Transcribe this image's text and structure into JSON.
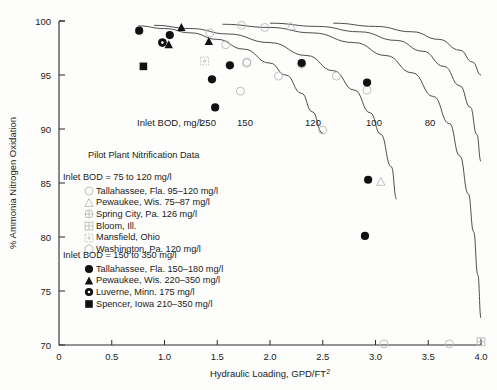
{
  "chart_data": {
    "type": "scatter",
    "title": "Pilot Plant Nitrification Data",
    "xlabel": "Hydraulic Loading, GPD/FT",
    "xlabel_sup": "2",
    "ylabel": "% Ammonia Nitrogen Oxidation",
    "xlim": [
      0,
      4.0
    ],
    "ylim": [
      70,
      100
    ],
    "xticks": [
      "0",
      "0.5",
      "1.0",
      "1.5",
      "2.0",
      "2.5",
      "3.0",
      "3.5",
      "4.0"
    ],
    "xtick_values": [
      0,
      0.5,
      1.0,
      1.5,
      2.0,
      2.5,
      3.0,
      3.5,
      4.0
    ],
    "yticks": [
      "70",
      "75",
      "80",
      "85",
      "90",
      "95",
      "100"
    ],
    "ytick_values": [
      70,
      75,
      80,
      85,
      90,
      95,
      100
    ],
    "grid": false,
    "curve_label_prefix": "Inlet BOD, mg/l",
    "curve_labels": [
      "250",
      "150",
      "120",
      "100",
      "80"
    ],
    "curves": [
      {
        "name": "250",
        "points": [
          [
            0.75,
            99.55
          ],
          [
            1.0,
            99.3
          ],
          [
            1.25,
            98.9
          ],
          [
            1.5,
            98.3
          ],
          [
            1.75,
            97.4
          ],
          [
            2.0,
            96.1
          ],
          [
            2.15,
            95.0
          ],
          [
            2.3,
            93.3
          ],
          [
            2.4,
            91.6
          ],
          [
            2.5,
            89.6
          ]
        ]
      },
      {
        "name": "150",
        "points": [
          [
            0.9,
            99.6
          ],
          [
            1.25,
            99.3
          ],
          [
            1.6,
            98.8
          ],
          [
            2.0,
            98.0
          ],
          [
            2.35,
            96.8
          ],
          [
            2.6,
            95.4
          ],
          [
            2.8,
            93.6
          ],
          [
            2.95,
            91.5
          ],
          [
            3.05,
            89.5
          ],
          [
            3.15,
            86.5
          ],
          [
            3.2,
            83.5
          ]
        ]
      },
      {
        "name": "120",
        "points": [
          [
            1.55,
            99.7
          ],
          [
            2.0,
            99.4
          ],
          [
            2.4,
            98.9
          ],
          [
            2.8,
            98.0
          ],
          [
            3.1,
            96.8
          ],
          [
            3.35,
            95.2
          ],
          [
            3.55,
            93.0
          ],
          [
            3.7,
            90.5
          ],
          [
            3.8,
            87.5
          ],
          [
            3.88,
            84.0
          ],
          [
            3.93,
            80.5
          ],
          [
            3.97,
            76.5
          ],
          [
            4.0,
            72.5
          ]
        ]
      },
      {
        "name": "100",
        "points": [
          [
            2.0,
            99.8
          ],
          [
            2.45,
            99.5
          ],
          [
            2.85,
            99.0
          ],
          [
            3.2,
            98.2
          ],
          [
            3.45,
            97.2
          ],
          [
            3.65,
            95.8
          ],
          [
            3.8,
            94.0
          ],
          [
            3.9,
            92.0
          ],
          [
            3.96,
            89.5
          ],
          [
            4.0,
            87.0
          ]
        ]
      },
      {
        "name": "80",
        "points": [
          [
            2.6,
            99.8
          ],
          [
            3.0,
            99.5
          ],
          [
            3.35,
            99.0
          ],
          [
            3.6,
            98.3
          ],
          [
            3.8,
            97.3
          ],
          [
            3.92,
            96.2
          ],
          [
            4.0,
            95.0
          ]
        ]
      }
    ],
    "series": [
      {
        "name": "Tallahassee, Fla. 95–120 mg/l",
        "group": "75-120",
        "marker": "open-circle",
        "points": [
          [
            1.43,
            98.9
          ],
          [
            1.58,
            97.8
          ],
          [
            1.73,
            99.6
          ],
          [
            1.95,
            99.4
          ],
          [
            1.78,
            96.2
          ],
          [
            2.08,
            94.9
          ],
          [
            2.63,
            94.9
          ],
          [
            2.92,
            93.6
          ],
          [
            1.72,
            93.5
          ],
          [
            2.5,
            89.9
          ],
          [
            3.08,
            70.1
          ],
          [
            3.7,
            70.1
          ]
        ]
      },
      {
        "name": "Pewaukee, Wis. 75–87 mg/l",
        "group": "75-120",
        "marker": "open-triangle",
        "points": [
          [
            2.2,
            99.5
          ],
          [
            3.05,
            85.1
          ]
        ]
      },
      {
        "name": "Spring City, Pa. 126 mg/l",
        "group": "75-120",
        "marker": "open-plus-circle",
        "points": [
          [
            2.3,
            96.0
          ]
        ]
      },
      {
        "name": "Bloom, Ill.",
        "group": "75-120",
        "marker": "open-grid-square",
        "points": [
          [
            4.0,
            70.3
          ]
        ]
      },
      {
        "name": "Mansfield, Ohio",
        "group": "75-120",
        "marker": "open-dotted-square",
        "points": [
          [
            1.38,
            96.3
          ]
        ]
      },
      {
        "name": "Washington, Pa. 120 mg/l",
        "group": "75-120",
        "marker": "open-hexagon",
        "points": [
          [
            1.78,
            96.1
          ]
        ]
      },
      {
        "name": "Tallahassee, Fla. 150–180 mg/l",
        "group": "150-350",
        "marker": "filled-circle",
        "points": [
          [
            0.76,
            99.1
          ],
          [
            1.05,
            98.7
          ],
          [
            0.98,
            98.0
          ],
          [
            1.62,
            95.9
          ],
          [
            2.3,
            96.1
          ],
          [
            1.45,
            94.6
          ],
          [
            1.48,
            92.0
          ],
          [
            2.92,
            94.3
          ],
          [
            2.93,
            85.3
          ],
          [
            2.9,
            80.1
          ]
        ]
      },
      {
        "name": "Pewaukee, Wis. 220–350 mg/l",
        "group": "150-350",
        "marker": "filled-triangle",
        "points": [
          [
            1.16,
            99.4
          ],
          [
            1.04,
            97.8
          ],
          [
            1.42,
            98.1
          ]
        ]
      },
      {
        "name": "Luverne, Minn. 175 mg/l",
        "group": "150-350",
        "marker": "filled-circle-dot",
        "points": [
          [
            0.98,
            98.0
          ]
        ]
      },
      {
        "name": "Spencer, Iowa 210–350 mg/l",
        "group": "150-350",
        "marker": "filled-square",
        "points": [
          [
            0.8,
            95.8
          ]
        ]
      }
    ]
  },
  "legend": {
    "title": "Pilot Plant Nitrification Data",
    "group1_header": "Inlet BOD = 75 to 120 mg/l",
    "group2_header": "Inlet BOD = 150 to 350 mg/l",
    "group1": [
      {
        "marker": "open-circle",
        "label": "Tallahassee, Fla. 95–120 mg/l"
      },
      {
        "marker": "open-triangle",
        "label": "Pewaukee, Wis. 75–87 mg/l"
      },
      {
        "marker": "open-plus-circle",
        "label": "Spring City, Pa. 126 mg/l"
      },
      {
        "marker": "open-grid-square",
        "label": "Bloom, Ill."
      },
      {
        "marker": "open-dotted-square",
        "label": "Mansfield, Ohio"
      },
      {
        "marker": "open-hexagon",
        "label": "Washington, Pa. 120 mg/l"
      }
    ],
    "group2": [
      {
        "marker": "filled-circle",
        "label": "Tallahassee, Fla. 150–180 mg/l"
      },
      {
        "marker": "filled-triangle",
        "label": "Pewaukee, Wis. 220–350 mg/l"
      },
      {
        "marker": "filled-circle-dot",
        "label": "Luverne, Minn. 175 mg/l"
      },
      {
        "marker": "filled-square",
        "label": "Spencer, Iowa 210–350 mg/l"
      }
    ]
  },
  "colors": {
    "axis": "#2b2b2b",
    "curve": "#3a3a3a",
    "marker_filled": "#111111",
    "marker_open": "#b9b9b9",
    "background": "#fdfdfc"
  }
}
